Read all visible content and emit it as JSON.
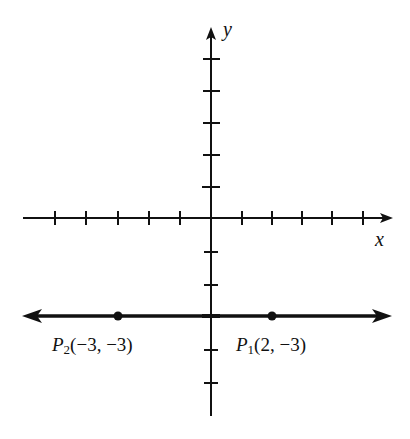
{
  "diagram": {
    "type": "coordinate-plane",
    "axes": {
      "x_label": "x",
      "y_label": "y",
      "x_ticks": [
        -6,
        -5,
        -4,
        -3,
        -2,
        -1,
        1,
        2,
        3,
        4,
        5
      ],
      "y_ticks": [
        5,
        4,
        3,
        2,
        1,
        -1,
        -2,
        -3,
        -4,
        -5
      ]
    },
    "line": {
      "description": "Horizontal line y = -3 with arrows on both ends",
      "y": -3
    },
    "points": [
      {
        "name": "P",
        "sub": "2",
        "coords": "(−3, −3)",
        "x": -3,
        "y": -3
      },
      {
        "name": "P",
        "sub": "1",
        "coords": "(2, −3)",
        "x": 2,
        "y": -3
      }
    ],
    "colors": {
      "ink": "#111111",
      "background": "#ffffff"
    }
  }
}
